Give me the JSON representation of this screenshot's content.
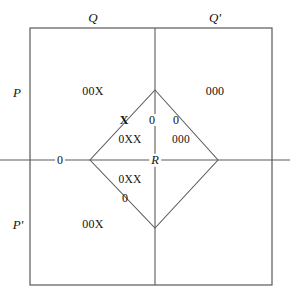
{
  "diagram": {
    "background_color": "#ffffff",
    "line_color": "#4a4a4a",
    "text_color": "#14120f",
    "outer_box": {
      "left": 30,
      "top": 28,
      "right": 272,
      "bottom": 285
    },
    "vertical_divider_x": 155,
    "horizontal_divider_y": 160,
    "diamond": {
      "top": [
        155,
        90
      ],
      "left": [
        90,
        160
      ],
      "right": [
        218,
        160
      ],
      "bottom": [
        155,
        228
      ]
    },
    "axis_labels": {
      "top_left": "Q",
      "top_right": "Q'",
      "left_upper": "P",
      "left_lower": "P'",
      "center": "R",
      "axis_origin": "0"
    },
    "region_labels": [
      {
        "text": "00X",
        "x": 93,
        "y": 91,
        "region": "upper-left-outer"
      },
      {
        "text": "000",
        "x": 215,
        "y": 91,
        "region": "upper-right-outer"
      },
      {
        "text": "00X",
        "x": 93,
        "y": 224,
        "region": "lower-left-outer"
      },
      {
        "text": "0XX",
        "x": 130,
        "y": 140,
        "region": "diamond-upper-left"
      },
      {
        "text": "000",
        "x": 181,
        "y": 140,
        "region": "diamond-upper-right"
      },
      {
        "text": "0XX",
        "x": 130,
        "y": 180,
        "region": "diamond-lower-left"
      }
    ],
    "edge_markers": [
      {
        "text": "X",
        "x": 124,
        "y": 120,
        "edge": "diamond-upper-left-edge"
      },
      {
        "text": "0",
        "x": 152,
        "y": 120,
        "edge": "vertical-divider-upper"
      },
      {
        "text": "0",
        "x": 176,
        "y": 120,
        "edge": "diamond-upper-right-edge"
      },
      {
        "text": "0",
        "x": 125,
        "y": 198,
        "edge": "diamond-lower-left-edge"
      },
      {
        "text": "0",
        "x": 60,
        "y": 160,
        "edge": "horizontal-axis-left"
      }
    ]
  }
}
